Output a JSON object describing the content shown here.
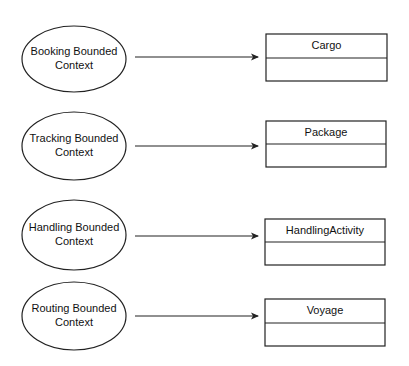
{
  "diagram": {
    "rows": [
      {
        "context": {
          "line1": "Booking Bounded",
          "line2": "Context",
          "cx": 74,
          "cy": 59,
          "rx": 52,
          "ry": 33
        },
        "arrow": {
          "x1": 135,
          "x2": 258,
          "y": 57
        },
        "entity": {
          "name": "Cargo",
          "x": 266,
          "y": 34,
          "w": 121,
          "h": 47,
          "divider_y": 58
        }
      },
      {
        "context": {
          "line1": "Tracking Bounded",
          "line2": "Context",
          "cx": 74,
          "cy": 146,
          "rx": 52,
          "ry": 34
        },
        "arrow": {
          "x1": 135,
          "x2": 258,
          "y": 146
        },
        "entity": {
          "name": "Package",
          "x": 266,
          "y": 121,
          "w": 120,
          "h": 46,
          "divider_y": 144
        }
      },
      {
        "context": {
          "line1": "Handling Bounded",
          "line2": "Context",
          "cx": 74,
          "cy": 235,
          "rx": 52,
          "ry": 35
        },
        "arrow": {
          "x1": 135,
          "x2": 258,
          "y": 236
        },
        "entity": {
          "name": "HandlingActivity",
          "x": 265,
          "y": 219,
          "w": 120,
          "h": 46,
          "divider_y": 242
        }
      },
      {
        "context": {
          "line1": "Routing Bounded",
          "line2": "Context",
          "cx": 74,
          "cy": 316,
          "rx": 52,
          "ry": 34
        },
        "arrow": {
          "x1": 135,
          "x2": 258,
          "y": 316
        },
        "entity": {
          "name": "Voyage",
          "x": 265,
          "y": 299,
          "w": 120,
          "h": 47,
          "divider_y": 323
        }
      }
    ]
  },
  "colors": {
    "stroke": "#222222",
    "background": "#ffffff",
    "text": "#111111"
  }
}
